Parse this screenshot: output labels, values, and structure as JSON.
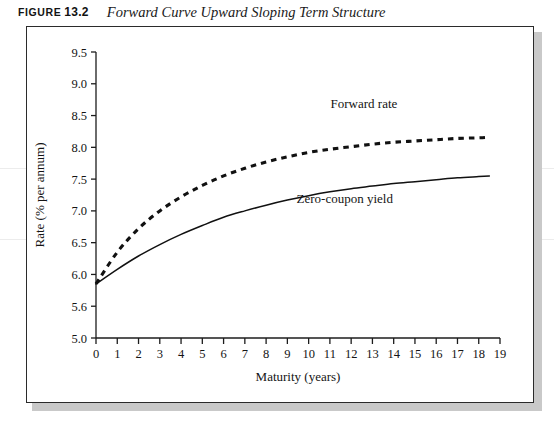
{
  "caption": {
    "figure_word": "FIGURE",
    "figure_number": "13.2",
    "title": "Forward Curve Upward Sloping Term Structure"
  },
  "chart_data": {
    "type": "line",
    "title": "Forward Curve Upward Sloping Term Structure",
    "xlabel": "Maturity (years)",
    "ylabel": "Rate (% per annum)",
    "xlim": [
      0,
      19
    ],
    "ylim": [
      5.0,
      9.5
    ],
    "grid": false,
    "legend": "inline-annotations",
    "xticks": [
      "0",
      "1",
      "2",
      "3",
      "4",
      "5",
      "6",
      "7",
      "8",
      "9",
      "10",
      "11",
      "12",
      "13",
      "14",
      "15",
      "16",
      "17",
      "18",
      "19"
    ],
    "yticks": [
      "5.0",
      "5.6",
      "6.0",
      "6.5",
      "7.0",
      "7.5",
      "8.0",
      "8.5",
      "9.0",
      "9.5"
    ],
    "ytick_values": [
      5.0,
      5.5,
      6.0,
      6.5,
      7.0,
      7.5,
      8.0,
      8.5,
      9.0,
      9.5
    ],
    "x": [
      0,
      1,
      2,
      3,
      4,
      5,
      6,
      7,
      8,
      9,
      10,
      11,
      12,
      13,
      14,
      15,
      16,
      17,
      18,
      18.5
    ],
    "series": [
      {
        "name": "Forward rate",
        "style": "dashed",
        "color": "#111111",
        "label_x": 12.6,
        "label_y": 8.62,
        "values": [
          5.85,
          6.35,
          6.72,
          7.0,
          7.22,
          7.4,
          7.55,
          7.67,
          7.77,
          7.85,
          7.92,
          7.97,
          8.01,
          8.05,
          8.08,
          8.1,
          8.12,
          8.14,
          8.15,
          8.16
        ]
      },
      {
        "name": "Zero-coupon yield",
        "style": "solid",
        "color": "#111111",
        "label_x": 11.7,
        "label_y": 7.12,
        "values": [
          5.85,
          6.08,
          6.29,
          6.47,
          6.63,
          6.77,
          6.9,
          7.0,
          7.09,
          7.17,
          7.24,
          7.3,
          7.35,
          7.39,
          7.43,
          7.46,
          7.49,
          7.52,
          7.54,
          7.55
        ]
      }
    ]
  }
}
